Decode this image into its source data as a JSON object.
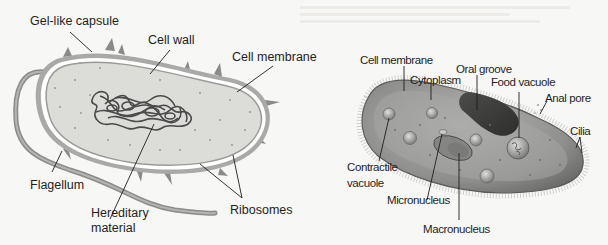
{
  "figure": {
    "bacterium": {
      "name": "Bacterium",
      "labels": [
        {
          "id": "gel_like_capsule",
          "text": "Gel-like capsule"
        },
        {
          "id": "cell_wall",
          "text": "Cell wall"
        },
        {
          "id": "cell_membrane",
          "text": "Cell membrane"
        },
        {
          "id": "flagellum",
          "text": "Flagellum"
        },
        {
          "id": "hereditary_material",
          "text": "Hereditary\nmaterial",
          "line1": "Hereditary",
          "line2": "material"
        },
        {
          "id": "ribosomes",
          "text": "Ribosomes"
        }
      ]
    },
    "paramecium": {
      "name": "Paramecium",
      "labels": [
        {
          "id": "cell_membrane",
          "text": "Cell membrane"
        },
        {
          "id": "cytoplasm",
          "text": "Cytoplasm"
        },
        {
          "id": "oral_groove",
          "text": "Oral groove"
        },
        {
          "id": "food_vacuole",
          "text": "Food vacuole"
        },
        {
          "id": "anal_pore",
          "text": "Anal pore"
        },
        {
          "id": "cilia",
          "text": "Cilia"
        },
        {
          "id": "contractile_vacuole",
          "text": "Contractile\nvacuole",
          "line1": "Contractile",
          "line2": "vacuole"
        },
        {
          "id": "micronucleus",
          "text": "Micronucleus"
        },
        {
          "id": "macronucleus",
          "text": "Macronucleus"
        }
      ]
    },
    "colors": {
      "bacterium_fill": "#dcdcd8",
      "bacterium_outline": "#8a8a88",
      "capsule": "#a8a8a6",
      "dna": "#4a4a4a",
      "paramecium_fill": "#9c9c9a",
      "paramecium_dark": "#5a5a58",
      "leader_line": "#1e1e1e"
    }
  }
}
